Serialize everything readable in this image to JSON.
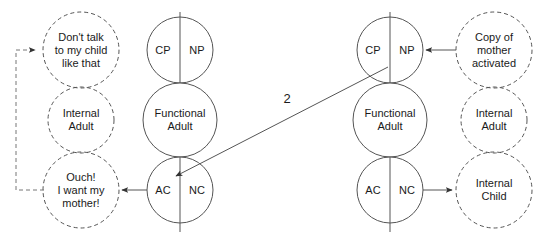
{
  "diagram": {
    "colors": {
      "stroke": "#555555",
      "text": "#1a1a1a",
      "background": "#ffffff"
    },
    "transaction_number": "2",
    "columns": {
      "left_internal": {
        "style": "dashed",
        "items": [
          {
            "lines": [
              "Don't talk",
              "to my child",
              "like that"
            ]
          },
          {
            "lines": [
              "Internal",
              "Adult"
            ]
          },
          {
            "lines": [
              "Ouch!",
              "I want my",
              "mother!"
            ]
          }
        ]
      },
      "left_person": {
        "style": "solid",
        "items": [
          {
            "left_label": "CP",
            "right_label": "NP"
          },
          {
            "lines": [
              "Functional",
              "Adult"
            ]
          },
          {
            "left_label": "AC",
            "right_label": "NC"
          }
        ]
      },
      "right_person": {
        "style": "solid",
        "items": [
          {
            "left_label": "CP",
            "right_label": "NP"
          },
          {
            "lines": [
              "Functional",
              "Adult"
            ]
          },
          {
            "left_label": "AC",
            "right_label": "NC"
          }
        ]
      },
      "right_internal": {
        "style": "dashed",
        "items": [
          {
            "lines": [
              "Copy of",
              "mother",
              "activated"
            ]
          },
          {
            "lines": [
              "Internal",
              "Adult"
            ]
          },
          {
            "lines": [
              "Internal",
              "Child"
            ]
          }
        ]
      }
    },
    "arrows": [
      {
        "name": "copy-of-mother-to-np",
        "from": "Copy of mother activated",
        "to": "NP (right person Parent)",
        "direction": "left",
        "style": "solid"
      },
      {
        "name": "right-cp-to-left-ac",
        "from": "CP (right person Parent)",
        "to": "AC (left person Child)",
        "direction": "diagonal-down-left",
        "style": "solid",
        "label": "2"
      },
      {
        "name": "left-ac-to-ouch",
        "from": "AC (left person Child)",
        "to": "Ouch! I want my mother!",
        "direction": "left",
        "style": "solid"
      },
      {
        "name": "right-nc-to-internal-child",
        "from": "NC (right person Child)",
        "to": "Internal Child",
        "direction": "right",
        "style": "solid"
      },
      {
        "name": "ouch-feedback-to-dont-talk",
        "from": "Ouch! I want my mother!",
        "to": "Don't talk to my child like that",
        "direction": "loop-left-up",
        "style": "dashed"
      }
    ]
  }
}
